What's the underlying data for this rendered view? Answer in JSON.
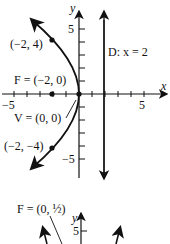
{
  "figure1": {
    "x_axis_label": "x",
    "y_axis_label": "y",
    "tick_neg5": "−5",
    "tick_pos5_x": "5",
    "tick_pos5_y": "5",
    "tick_neg5_y": "−5",
    "point_top": "(−2, 4)",
    "point_bottom": "(−2, −4)",
    "focus": "F = (−2, 0)",
    "vertex": "V = (0, 0)",
    "directrix": "D: x = 2"
  },
  "figure2": {
    "focus_label": "F = (0, ½)",
    "y_axis_label": "y",
    "tick_pos5_y": "5"
  },
  "colors": {
    "ink": "#111111",
    "background": "#ffffff"
  }
}
